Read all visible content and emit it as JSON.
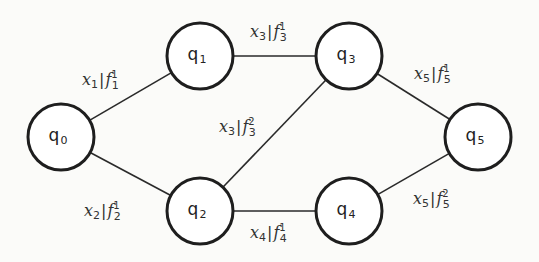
{
  "diagram": {
    "type": "state-transition-graph",
    "nodes": [
      {
        "id": "q0",
        "base": "q",
        "sub": "0",
        "cx": 61,
        "cy": 137,
        "r": 33
      },
      {
        "id": "q1",
        "base": "q",
        "sub": "1",
        "cx": 200,
        "cy": 56,
        "r": 33
      },
      {
        "id": "q2",
        "base": "q",
        "sub": "2",
        "cx": 200,
        "cy": 211,
        "r": 33
      },
      {
        "id": "q3",
        "base": "q",
        "sub": "3",
        "cx": 349,
        "cy": 56,
        "r": 33
      },
      {
        "id": "q4",
        "base": "q",
        "sub": "4",
        "cx": 349,
        "cy": 211,
        "r": 33
      },
      {
        "id": "q5",
        "base": "q",
        "sub": "5",
        "cx": 478,
        "cy": 137,
        "r": 33
      }
    ],
    "edges": [
      {
        "from": "q0",
        "to": "q1",
        "label": {
          "x": "x",
          "xsub": "1",
          "f": "f",
          "fsub": "1",
          "fsup": "1",
          "lx": 82,
          "ly": 85
        }
      },
      {
        "from": "q0",
        "to": "q2",
        "label": {
          "x": "x",
          "xsub": "2",
          "f": "f",
          "fsub": "2",
          "fsup": "1",
          "lx": 84,
          "ly": 216
        }
      },
      {
        "from": "q1",
        "to": "q3",
        "label": {
          "x": "x",
          "xsub": "3",
          "f": "f",
          "fsub": "3",
          "fsup": "1",
          "lx": 250,
          "ly": 37
        }
      },
      {
        "from": "q2",
        "to": "q3",
        "label": {
          "x": "x",
          "xsub": "3",
          "f": "f",
          "fsub": "3",
          "fsup": "2",
          "lx": 219,
          "ly": 132
        }
      },
      {
        "from": "q2",
        "to": "q4",
        "label": {
          "x": "x",
          "xsub": "4",
          "f": "f",
          "fsub": "4",
          "fsup": "1",
          "lx": 250,
          "ly": 238
        }
      },
      {
        "from": "q3",
        "to": "q5",
        "label": {
          "x": "x",
          "xsub": "5",
          "f": "f",
          "fsub": "5",
          "fsup": "1",
          "lx": 414,
          "ly": 79
        }
      },
      {
        "from": "q4",
        "to": "q5",
        "label": {
          "x": "x",
          "xsub": "5",
          "f": "f",
          "fsub": "5",
          "fsup": "2",
          "lx": 413,
          "ly": 204
        }
      }
    ],
    "colors": {
      "background": "#fbfbf9",
      "stroke": "#1e1e1e",
      "text": "#333333"
    }
  }
}
